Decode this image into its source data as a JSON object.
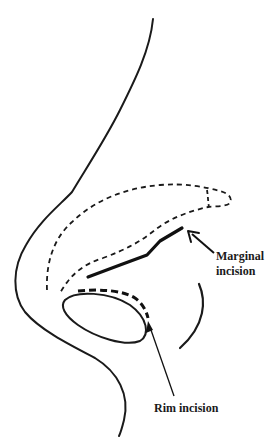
{
  "figure": {
    "stroke_color": "#1a1a1a",
    "background": "#ffffff"
  },
  "labels": {
    "marginal_line1": "Marginal",
    "marginal_line2": "incision",
    "rim": "Rim incision"
  },
  "legend_items": [
    {
      "name": "Marginal incision",
      "style": "thick solid line"
    },
    {
      "name": "Rim incision",
      "style": "thick dashed line"
    }
  ]
}
